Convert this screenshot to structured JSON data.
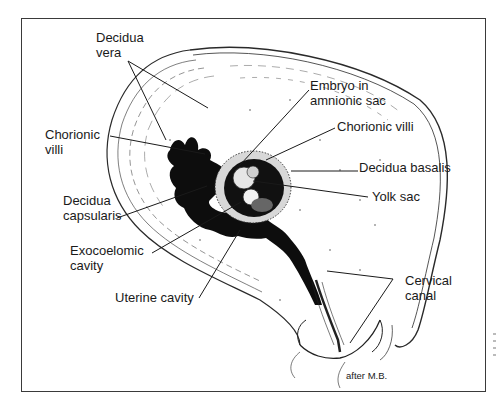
{
  "figure": {
    "credit": "after M.B."
  },
  "labels": {
    "decidua_vera": "Decidua\nvera",
    "chorionic_villi_left": "Chorionic\nvilli",
    "decidua_capsularis": "Decidua\ncapsularis",
    "exocoelomic_cavity": "Exocoelomic\ncavity",
    "uterine_cavity": "Uterine cavity",
    "embryo_in_amnionic_sac": "Embryo in\namnionic sac",
    "chorionic_villi_right": "Chorionic villi",
    "decidua_basalis": "Decidua basalis",
    "yolk_sac": "Yolk sac",
    "cervical_canal": "Cervical\ncanal"
  },
  "colors": {
    "ink": "#1a1a1a",
    "frame": "#3a3a3a",
    "background": "#ffffff"
  }
}
